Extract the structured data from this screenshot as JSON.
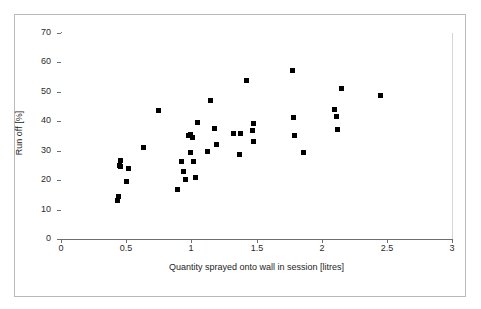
{
  "chart_data": {
    "type": "scatter",
    "title": "",
    "xlabel": "Quantity sprayed onto wall in session [litres]",
    "ylabel": "Run off [%]",
    "xlim": [
      0,
      3
    ],
    "ylim": [
      0,
      70
    ],
    "xticks": [
      0,
      0.5,
      1,
      1.5,
      2,
      2.5,
      3
    ],
    "xtick_labels": [
      "0",
      "0.5",
      "1",
      "1.5",
      "2",
      "2.5",
      "3"
    ],
    "yticks": [
      0,
      10,
      20,
      30,
      40,
      50,
      60,
      70
    ],
    "ytick_labels": [
      "0",
      "10",
      "20",
      "30",
      "40",
      "50",
      "60",
      "70"
    ],
    "grid": false,
    "legend": null,
    "marker": "filled-square",
    "marker_color": "#000000",
    "series": [
      {
        "name": "Run off vs quantity sprayed",
        "points": [
          [
            0.435,
            13.2
          ],
          [
            0.44,
            14.3
          ],
          [
            0.45,
            25.0
          ],
          [
            0.455,
            26.6
          ],
          [
            0.46,
            24.5
          ],
          [
            0.505,
            19.4
          ],
          [
            0.52,
            24.1
          ],
          [
            0.635,
            31.1
          ],
          [
            0.75,
            43.6
          ],
          [
            0.895,
            16.9
          ],
          [
            0.925,
            26.3
          ],
          [
            0.94,
            23.0
          ],
          [
            0.955,
            20.3
          ],
          [
            0.98,
            35.2
          ],
          [
            0.99,
            35.5
          ],
          [
            0.995,
            29.5
          ],
          [
            1.01,
            34.5
          ],
          [
            1.02,
            26.5
          ],
          [
            1.035,
            20.8
          ],
          [
            1.045,
            39.6
          ],
          [
            1.15,
            47.0
          ],
          [
            1.175,
            37.6
          ],
          [
            1.125,
            29.9
          ],
          [
            1.19,
            32.2
          ],
          [
            1.32,
            35.8
          ],
          [
            1.38,
            36.0
          ],
          [
            1.37,
            28.7
          ],
          [
            1.425,
            53.9
          ],
          [
            1.475,
            39.4
          ],
          [
            1.47,
            36.9
          ],
          [
            1.48,
            33.3
          ],
          [
            1.78,
            57.2
          ],
          [
            1.785,
            41.4
          ],
          [
            1.79,
            35.2
          ],
          [
            1.86,
            29.4
          ],
          [
            2.095,
            43.9
          ],
          [
            2.11,
            41.6
          ],
          [
            2.125,
            37.3
          ],
          [
            2.155,
            51.2
          ],
          [
            2.45,
            48.8
          ]
        ]
      }
    ]
  }
}
